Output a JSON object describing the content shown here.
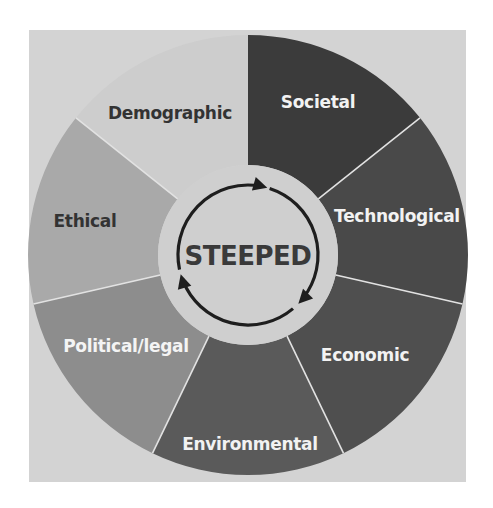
{
  "diagram": {
    "title": "STEEPED",
    "center_label": "STEEPED",
    "background_color": "#d3d3d3",
    "center_fill": "#cfcfcf",
    "divider_color": "#e2e2e2",
    "cycle_icon": "circular-arrows-icon",
    "segments": [
      {
        "label": "Societal",
        "fill": "#3b3b3b",
        "text_color": "#f2f2f2"
      },
      {
        "label": "Technological",
        "fill": "#494949",
        "text_color": "#f2f2f2"
      },
      {
        "label": "Economic",
        "fill": "#4f4f4f",
        "text_color": "#f2f2f2"
      },
      {
        "label": "Environmental",
        "fill": "#5a5a5a",
        "text_color": "#f2f2f2"
      },
      {
        "label": "Political/legal",
        "fill": "#8d8d8d",
        "text_color": "#f4f4f4"
      },
      {
        "label": "Ethical",
        "fill": "#a9a9a9",
        "text_color": "#333333"
      },
      {
        "label": "Demographic",
        "fill": "#cdcdcd",
        "text_color": "#333333"
      }
    ]
  }
}
